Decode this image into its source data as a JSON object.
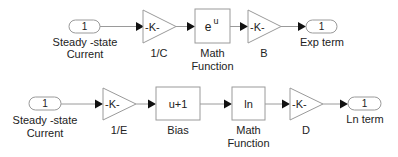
{
  "diagram": {
    "rows": [
      {
        "inport": {
          "number": "1",
          "label_line1": "Steady -state",
          "label_line2": "Current"
        },
        "gain1": {
          "text": "-K-",
          "label": "1/C"
        },
        "math": {
          "base": "e",
          "exponent": "u",
          "label_line1": "Math",
          "label_line2": "Function"
        },
        "gain2": {
          "text": "-K-",
          "label": "B"
        },
        "outport": {
          "number": "1",
          "label": "Exp term"
        }
      },
      {
        "inport": {
          "number": "1",
          "label_line1": "Steady -state",
          "label_line2": "Current"
        },
        "gain1": {
          "text": "-K-",
          "label": "1/E"
        },
        "bias": {
          "text": "u+1",
          "label": "Bias"
        },
        "math": {
          "text": "ln",
          "label_line1": "Math",
          "label_line2": "Function"
        },
        "gain2": {
          "text": "-K-",
          "label": "D"
        },
        "outport": {
          "number": "1",
          "label": "Ln term"
        }
      }
    ]
  }
}
